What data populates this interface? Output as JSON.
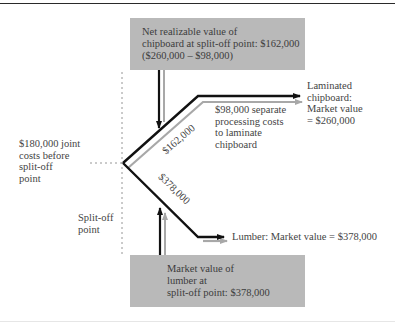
{
  "diagram": {
    "top_box": {
      "lines": [
        "Net realizable value of",
        "chipboard at split-off point:  $162,000",
        "($260,000 – $98,000)"
      ]
    },
    "bottom_box": {
      "lines": [
        "Market value of",
        "lumber at",
        "split-off point:  $378,000"
      ]
    },
    "joint_costs_label": {
      "lines": [
        "$180,000 joint",
        "costs before",
        "split-off",
        "point"
      ]
    },
    "split_off_label": {
      "lines": [
        "Split-off",
        "point"
      ]
    },
    "laminated_label": {
      "lines": [
        "Laminated",
        "chipboard:",
        "Market value",
        "= $260,000"
      ]
    },
    "separate_costs_label": {
      "lines": [
        "$98,000 separate",
        "processing costs",
        "to laminate",
        "chipboard"
      ]
    },
    "lumber_label": "Lumber:  Market value = $378,000",
    "upper_branch_value": "$162,000",
    "lower_branch_value": "$378,000",
    "colors": {
      "box_fill": "#b9b9b9",
      "primary_line": "#111111",
      "secondary_line": "#a8a8a8",
      "dashed_line": "#8a8a8a",
      "text": "#444444"
    }
  }
}
